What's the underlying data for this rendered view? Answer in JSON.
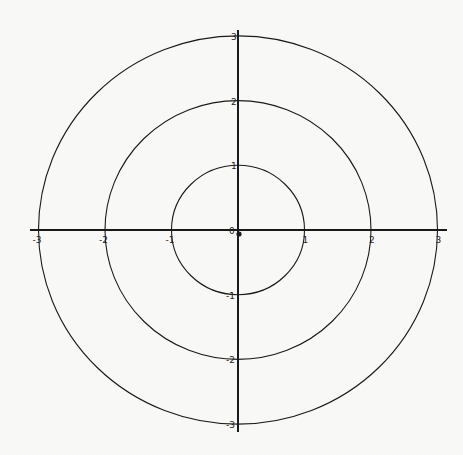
{
  "figure": {
    "colors": {
      "background": "#f8f8f7",
      "stroke": "#1a1a1a"
    },
    "origin_px": {
      "x": 238,
      "y": 230
    },
    "unit_px": {
      "x": 66.5,
      "y": 64.7
    },
    "x_axis": {
      "range": [
        -3.13,
        3.15
      ],
      "ticks": [
        "-3",
        "-2",
        "-1",
        "1",
        "2",
        "3"
      ]
    },
    "y_axis": {
      "range": [
        -3.12,
        3.12
      ],
      "ticks": [
        "3",
        "2",
        "1",
        "-1",
        "-2",
        "-3"
      ]
    },
    "origin_label": "0",
    "circles": [
      {
        "radius": 1
      },
      {
        "radius": 2
      },
      {
        "radius": 3
      }
    ]
  }
}
